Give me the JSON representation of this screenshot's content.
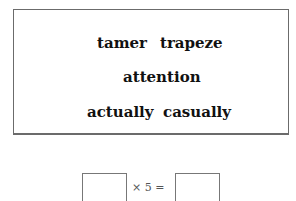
{
  "word_panel": {
    "words": [
      "tamer",
      "trapeze",
      "attention",
      "actually",
      "casually"
    ]
  },
  "equation": {
    "times_symbol": "×",
    "multiplier": "5",
    "equals_symbol": "=",
    "expression": "× 5 =",
    "left_box_value": "",
    "right_box_value": ""
  }
}
